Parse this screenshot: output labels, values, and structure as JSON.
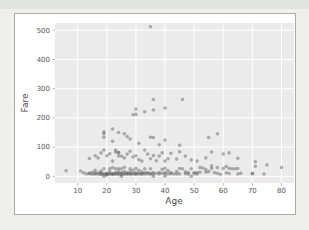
{
  "window": {
    "background": "#eff0ec",
    "top_strip_color": "#e2e4e0"
  },
  "figure": {
    "background": "#ffffff",
    "border_color": "#ababab"
  },
  "chart_data": {
    "type": "scatter",
    "title": "",
    "xlabel": "Age",
    "ylabel": "Fare",
    "xlim": [
      2.2,
      84.3
    ],
    "ylim": [
      -23,
      525
    ],
    "xticks": [
      10,
      20,
      30,
      40,
      50,
      60,
      70,
      80
    ],
    "yticks": [
      0,
      100,
      200,
      300,
      400,
      500
    ],
    "grid": true,
    "legend_position": "none",
    "plot_bg": "#ebebeb",
    "grid_color": "#ffffff",
    "tick_color": "#aaaaaa",
    "point_color": "#595959",
    "point_opacity": 0.45,
    "point_radius": 1.8,
    "points": [
      [
        35,
        512
      ],
      [
        36,
        263
      ],
      [
        46,
        263
      ],
      [
        30,
        230
      ],
      [
        33,
        221
      ],
      [
        36,
        227
      ],
      [
        40,
        234
      ],
      [
        29,
        211
      ],
      [
        30,
        212
      ],
      [
        19,
        152
      ],
      [
        19,
        146
      ],
      [
        19,
        134
      ],
      [
        22,
        162
      ],
      [
        24,
        150
      ],
      [
        27,
        136
      ],
      [
        28,
        128
      ],
      [
        35,
        134
      ],
      [
        36,
        133
      ],
      [
        40,
        124
      ],
      [
        55,
        133
      ],
      [
        58,
        146
      ],
      [
        31,
        113
      ],
      [
        38,
        108
      ],
      [
        45,
        106
      ],
      [
        22,
        120
      ],
      [
        26,
        146
      ],
      [
        14,
        61
      ],
      [
        16,
        70
      ],
      [
        17,
        63
      ],
      [
        18,
        80
      ],
      [
        19,
        90
      ],
      [
        20,
        70
      ],
      [
        21,
        77
      ],
      [
        22,
        52
      ],
      [
        23,
        90
      ],
      [
        23,
        83
      ],
      [
        24,
        80
      ],
      [
        24,
        82
      ],
      [
        24,
        69
      ],
      [
        25,
        69
      ],
      [
        26,
        63
      ],
      [
        27,
        76
      ],
      [
        28,
        86
      ],
      [
        29,
        66
      ],
      [
        30,
        70
      ],
      [
        31,
        57
      ],
      [
        32,
        52
      ],
      [
        33,
        90
      ],
      [
        34,
        76
      ],
      [
        35,
        60
      ],
      [
        36,
        71
      ],
      [
        37,
        53
      ],
      [
        38,
        69
      ],
      [
        39,
        80
      ],
      [
        40,
        52
      ],
      [
        41,
        60
      ],
      [
        42,
        79
      ],
      [
        44,
        59
      ],
      [
        45,
        84
      ],
      [
        47,
        69
      ],
      [
        49,
        56
      ],
      [
        51,
        52
      ],
      [
        54,
        63
      ],
      [
        56,
        83
      ],
      [
        60,
        76
      ],
      [
        62,
        80
      ],
      [
        65,
        62
      ],
      [
        71,
        49.5
      ],
      [
        71,
        34.65
      ],
      [
        75,
        39
      ],
      [
        6,
        19
      ],
      [
        11,
        18
      ],
      [
        12,
        12
      ],
      [
        13,
        8
      ],
      [
        14,
        9
      ],
      [
        14,
        11
      ],
      [
        15,
        7.2
      ],
      [
        15,
        14
      ],
      [
        16,
        8
      ],
      [
        16,
        10
      ],
      [
        16,
        20
      ],
      [
        17,
        7.1
      ],
      [
        17,
        12
      ],
      [
        18,
        6.5
      ],
      [
        18,
        8
      ],
      [
        18,
        13
      ],
      [
        18,
        18
      ],
      [
        19,
        7.8
      ],
      [
        19,
        8.05
      ],
      [
        19,
        26
      ],
      [
        19,
        0
      ],
      [
        20,
        4
      ],
      [
        20,
        7.25
      ],
      [
        20,
        8.05
      ],
      [
        20,
        9.8
      ],
      [
        21,
        7.8
      ],
      [
        21,
        8
      ],
      [
        21,
        16
      ],
      [
        21,
        26
      ],
      [
        22,
        7.25
      ],
      [
        22,
        7.8
      ],
      [
        22,
        9
      ],
      [
        22,
        29
      ],
      [
        23,
        7.8
      ],
      [
        23,
        8.05
      ],
      [
        23,
        13
      ],
      [
        23,
        26
      ],
      [
        24,
        7.5
      ],
      [
        24,
        8.05
      ],
      [
        24,
        16
      ],
      [
        24,
        26
      ],
      [
        25,
        7.2
      ],
      [
        25,
        7.9
      ],
      [
        25,
        13
      ],
      [
        25,
        26
      ],
      [
        25,
        0
      ],
      [
        26,
        7.8
      ],
      [
        26,
        8.05
      ],
      [
        26,
        16
      ],
      [
        26,
        31
      ],
      [
        27,
        7.9
      ],
      [
        27,
        8.6
      ],
      [
        27,
        12
      ],
      [
        28,
        7.8
      ],
      [
        28,
        8.05
      ],
      [
        28,
        15
      ],
      [
        28,
        26
      ],
      [
        29,
        7.9
      ],
      [
        29,
        9.5
      ],
      [
        29,
        21
      ],
      [
        30,
        7.2
      ],
      [
        30,
        8.05
      ],
      [
        30,
        13
      ],
      [
        30,
        27
      ],
      [
        31,
        7.9
      ],
      [
        31,
        10.5
      ],
      [
        31,
        21
      ],
      [
        32,
        7.8
      ],
      [
        32,
        8.05
      ],
      [
        32,
        15
      ],
      [
        33,
        7.9
      ],
      [
        33,
        12
      ],
      [
        33,
        26
      ],
      [
        34,
        8.05
      ],
      [
        34,
        13
      ],
      [
        35,
        7.2
      ],
      [
        35,
        10.5
      ],
      [
        35,
        26
      ],
      [
        36,
        7.9
      ],
      [
        36,
        13
      ],
      [
        36,
        0
      ],
      [
        37,
        9.6
      ],
      [
        38,
        7.9
      ],
      [
        38,
        13
      ],
      [
        39,
        10.5
      ],
      [
        39,
        24
      ],
      [
        40,
        7.9
      ],
      [
        40,
        13
      ],
      [
        40,
        27.7
      ],
      [
        40,
        0
      ],
      [
        41,
        8.05
      ],
      [
        41,
        19.5
      ],
      [
        42,
        8.7
      ],
      [
        42,
        13
      ],
      [
        43,
        8.05
      ],
      [
        44,
        8.05
      ],
      [
        44,
        16.1
      ],
      [
        45,
        8.05
      ],
      [
        45,
        26.55
      ],
      [
        46,
        26
      ],
      [
        47,
        9
      ],
      [
        47,
        15
      ],
      [
        48,
        7.55
      ],
      [
        48,
        13
      ],
      [
        49,
        0
      ],
      [
        49,
        25.9
      ],
      [
        50,
        8.05
      ],
      [
        50,
        13
      ],
      [
        51,
        7.75
      ],
      [
        51,
        12.5
      ],
      [
        52,
        13.5
      ],
      [
        52,
        30.5
      ],
      [
        53,
        28.5
      ],
      [
        54,
        14
      ],
      [
        54,
        23
      ],
      [
        55,
        16
      ],
      [
        56,
        26.55
      ],
      [
        56,
        35.5
      ],
      [
        57,
        12.35
      ],
      [
        58,
        10.5
      ],
      [
        58,
        29.7
      ],
      [
        59,
        7.25
      ],
      [
        60,
        26.55
      ],
      [
        61,
        12.35
      ],
      [
        61,
        33.5
      ],
      [
        62,
        9.6
      ],
      [
        62,
        27.7
      ],
      [
        63,
        26
      ],
      [
        64,
        26
      ],
      [
        65,
        7.75
      ],
      [
        65,
        26.55
      ],
      [
        66,
        10.5
      ],
      [
        70,
        10.5
      ],
      [
        70,
        7.75
      ],
      [
        74,
        7.775
      ],
      [
        80,
        30
      ]
    ]
  }
}
